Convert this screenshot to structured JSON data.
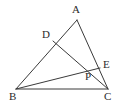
{
  "figure": {
    "kind": "geometry-diagram",
    "background_color": "#ffffff",
    "stroke_color": "#3a3a3a",
    "label_color": "#2b2b2b",
    "stroke_width": 1,
    "width": 123,
    "height": 111,
    "points": [
      {
        "id": "A",
        "label": "A",
        "x": 77,
        "y": 20,
        "label_x": 72,
        "label_y": 4
      },
      {
        "id": "B",
        "label": "B",
        "x": 16,
        "y": 89,
        "label_x": 9,
        "label_y": 91
      },
      {
        "id": "C",
        "label": "C",
        "x": 108,
        "y": 89,
        "label_x": 104,
        "label_y": 91
      },
      {
        "id": "D",
        "label": "D",
        "x": 53,
        "y": 41,
        "label_x": 42,
        "label_y": 29
      },
      {
        "id": "E",
        "label": "E",
        "x": 100,
        "y": 68,
        "label_x": 103,
        "label_y": 59
      },
      {
        "id": "P",
        "label": "P",
        "x": 89,
        "y": 73,
        "label_x": 85,
        "label_y": 71
      }
    ],
    "segments": [
      {
        "id": "AB",
        "from": "A",
        "to": "B",
        "name": "segment-ab"
      },
      {
        "id": "AC",
        "from": "A",
        "to": "C",
        "name": "segment-ac"
      },
      {
        "id": "BC",
        "from": "B",
        "to": "C",
        "name": "segment-bc"
      },
      {
        "id": "BE",
        "from": "B",
        "to": "E",
        "name": "segment-be"
      },
      {
        "id": "DC",
        "from": "D",
        "to": "C",
        "name": "segment-dc"
      }
    ]
  }
}
